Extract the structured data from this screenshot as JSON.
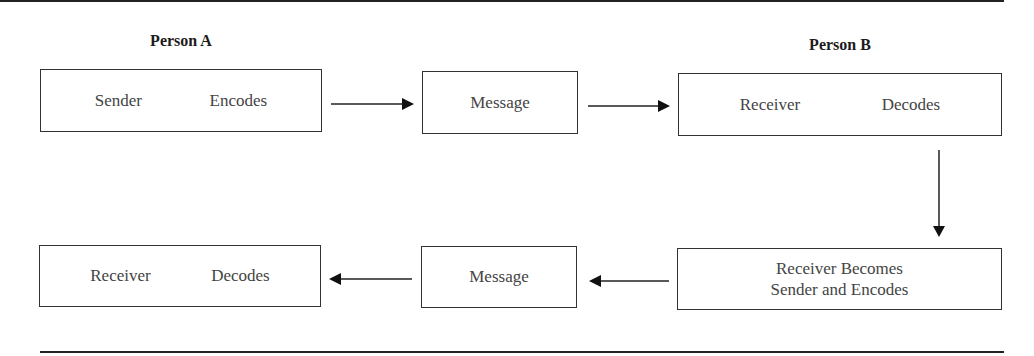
{
  "diagram": {
    "person_a_label": "Person A",
    "person_b_label": "Person B",
    "boxes": {
      "a_top": {
        "left": "Sender",
        "right": "Encodes"
      },
      "message_top": {
        "text": "Message"
      },
      "b_top": {
        "left": "Receiver",
        "right": "Decodes"
      },
      "b_bottom": {
        "line1": "Receiver Becomes",
        "line2": "Sender and Encodes"
      },
      "message_bottom": {
        "text": "Message"
      },
      "a_bottom": {
        "left": "Receiver",
        "right": "Decodes"
      }
    },
    "arrows": [
      {
        "from": "a_top",
        "to": "message_top",
        "direction": "right"
      },
      {
        "from": "message_top",
        "to": "b_top",
        "direction": "right"
      },
      {
        "from": "b_top",
        "to": "b_bottom",
        "direction": "down"
      },
      {
        "from": "b_bottom",
        "to": "message_bottom",
        "direction": "left"
      },
      {
        "from": "message_bottom",
        "to": "a_bottom",
        "direction": "left"
      }
    ],
    "colors": {
      "line": "#222222",
      "text": "#444444",
      "background": "#ffffff"
    }
  }
}
